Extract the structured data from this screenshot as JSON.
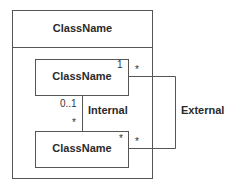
{
  "outer_class": {
    "name": "ClassName"
  },
  "inner_classes": [
    {
      "name": "ClassName",
      "multiplicity_top_right": "1"
    },
    {
      "name": "ClassName",
      "multiplicity_top_right": "*"
    }
  ],
  "associations": {
    "internal": {
      "label": "Internal",
      "source_multiplicity": "0..1",
      "target_multiplicity": "*"
    },
    "external": {
      "label": "External",
      "source_multiplicity": "*",
      "target_multiplicity": "*"
    }
  },
  "colors": {
    "line": "#555555",
    "text": "#2a2a2a",
    "background": "#ffffff"
  }
}
